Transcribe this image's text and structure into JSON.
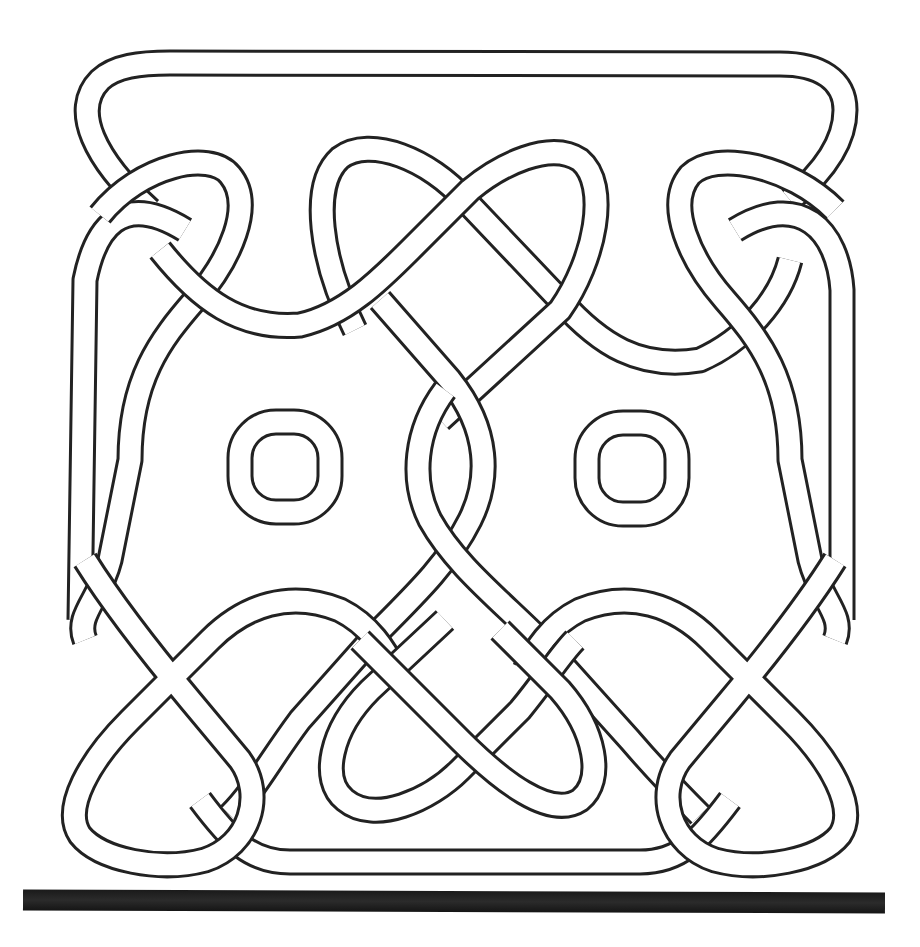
{
  "figure": {
    "colors": {
      "line": "#222222",
      "background": "#ffffff",
      "bar": "#1a1a1a"
    },
    "elements": {
      "outer_frame": "rounded top band",
      "left_ring": "rounded-square ring (left)",
      "right_ring": "rounded-square ring (right)",
      "base_bar": "thick black horizontal bar"
    }
  }
}
